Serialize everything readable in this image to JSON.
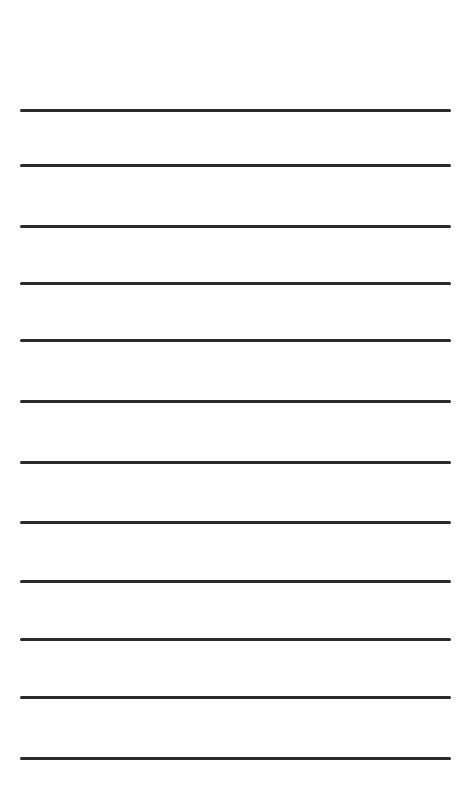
{
  "page": {
    "type": "lined-paper",
    "background_color": "#ffffff",
    "line_color": "#2b2b2b",
    "line_count": 12,
    "line_left_px": 20,
    "line_right_px": 451,
    "line_thickness_px": 3,
    "line_y_positions_px": [
      110,
      165,
      226,
      283,
      340,
      401,
      462,
      522,
      581,
      639,
      697,
      758
    ]
  }
}
